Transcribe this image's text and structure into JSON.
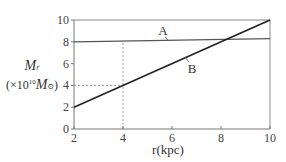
{
  "chart_data": {
    "type": "line",
    "title": "",
    "xlabel": "r(kpc)",
    "ylabel": "M_r (×10^10 M_☉)",
    "ylabel_parts": {
      "symbol": "M",
      "subscript": "r",
      "unit_prefix": "(×10",
      "exponent": "10",
      "unit_symbol": "M",
      "unit_subscript": "⊙",
      "close": ")"
    },
    "xlim": [
      2,
      10
    ],
    "ylim": [
      0,
      10
    ],
    "xticks": [
      2,
      4,
      6,
      8,
      10
    ],
    "yticks": [
      0,
      2,
      4,
      6,
      8,
      10
    ],
    "xtick_labels": [
      "2",
      "4",
      "6",
      "8",
      "10"
    ],
    "ytick_labels": [
      "0",
      "2",
      "4",
      "6",
      "8",
      "10"
    ],
    "grid": false,
    "series": [
      {
        "name": "A",
        "x": [
          2,
          10
        ],
        "y": [
          8.0,
          8.3
        ],
        "color": "#555555"
      },
      {
        "name": "B",
        "x": [
          2,
          10
        ],
        "y": [
          2,
          10
        ],
        "color": "#222222"
      }
    ],
    "annotations": [
      {
        "type": "dashed-guide",
        "from": [
          4,
          0
        ],
        "to": [
          4,
          8.0
        ],
        "note": "vertical dotted line at r=4"
      },
      {
        "type": "dashed-guide",
        "from": [
          2,
          4
        ],
        "to": [
          4,
          4
        ],
        "note": "horizontal dotted line at M=4"
      },
      {
        "type": "label",
        "text": "A",
        "at": [
          5.5,
          8.05
        ]
      },
      {
        "type": "label",
        "text": "B",
        "at": [
          6.5,
          6.5
        ]
      }
    ],
    "legend": "none (inline labels A and B)"
  }
}
